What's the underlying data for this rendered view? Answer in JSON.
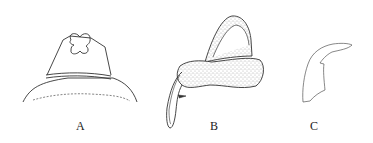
{
  "figure": {
    "panels": [
      {
        "label": "A",
        "description": "head structure, dorsal view"
      },
      {
        "label": "B",
        "description": "stippled organ with looped duct"
      },
      {
        "label": "C",
        "description": "hooked sclerite outline"
      }
    ],
    "colors": {
      "line": "#333333",
      "stipple": "#555555",
      "background": "#ffffff"
    }
  }
}
